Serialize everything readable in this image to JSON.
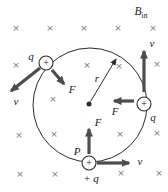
{
  "figure": {
    "title_hint": "Positive charges moving in a circle in a magnetic field directed into the page",
    "field": {
      "label": {
        "symbol": "B",
        "subscript": "in"
      },
      "symbol": "×",
      "crosses": [
        [
          16,
          28
        ],
        [
          50,
          28
        ],
        [
          84,
          28
        ],
        [
          118,
          28
        ],
        [
          153,
          28
        ],
        [
          16,
          65
        ],
        [
          87,
          65
        ],
        [
          119,
          66
        ],
        [
          157,
          64
        ],
        [
          53,
          99
        ],
        [
          19,
          135
        ],
        [
          54,
          134
        ],
        [
          120,
          134
        ],
        [
          157,
          133
        ],
        [
          20,
          174
        ],
        [
          55,
          174
        ],
        [
          121,
          173
        ],
        [
          159,
          173
        ]
      ]
    },
    "radius_label": "r",
    "point_label": "P",
    "charges": [
      {
        "position": "upper-left",
        "symbol": "+",
        "label": "q",
        "velocity_label": "v",
        "force_label": "F"
      },
      {
        "position": "right",
        "symbol": "+",
        "label": "q",
        "velocity_label": "v",
        "force_label": "F"
      },
      {
        "position": "bottom",
        "symbol": "+",
        "label": "+ q",
        "velocity_label": "v",
        "force_label": "F"
      }
    ],
    "colors": {
      "background": "#ffffff",
      "arrow": "#4d4d4d",
      "line": "#2b2b2b",
      "cross": "#787878",
      "text": "#1a1a1a"
    }
  }
}
